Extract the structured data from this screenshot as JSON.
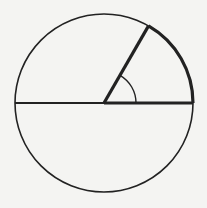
{
  "diagram": {
    "type": "circle-sector",
    "colors": {
      "background": "#f4f4f2",
      "stroke": "#222222"
    },
    "circle": {
      "cx": 104,
      "cy": 103,
      "r": 89
    },
    "angle_degrees": 60
  }
}
